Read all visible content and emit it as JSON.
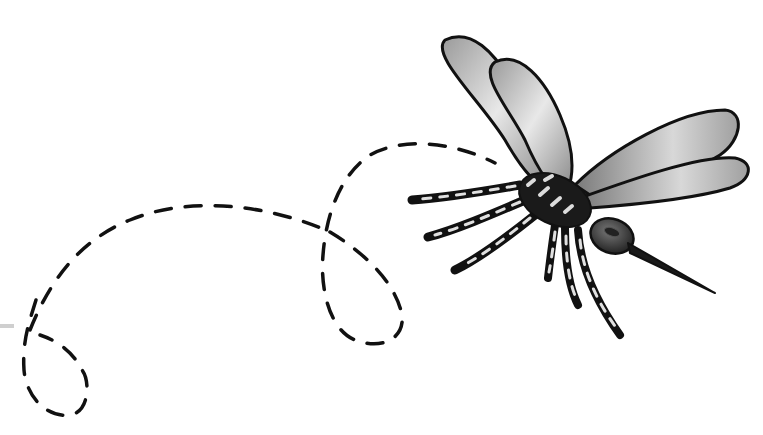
{
  "image": {
    "subject": "mosquito",
    "description": "Grayscale illustration of a flying mosquito with a looping dashed flight path trailing behind it",
    "background_color": "#ffffff",
    "ink_color": "#111111",
    "wing_fill": "#b8b8b8",
    "wing_highlight": "#e6e6e6",
    "body_color": "#1a1a1a",
    "leg_stripe_color": "#dcdcdc",
    "flight_path": {
      "style": "dashed",
      "loops": 2
    }
  }
}
